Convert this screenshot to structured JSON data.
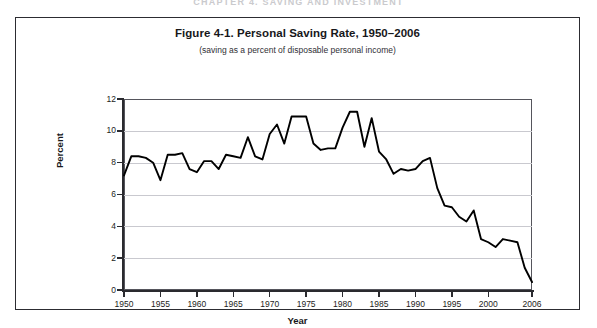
{
  "page": {
    "running_head": "CHAPTER 4. SAVING AND INVESTMENT"
  },
  "figure": {
    "title": "Figure 4-1. Personal Saving Rate, 1950–2006",
    "subtitle": "(saving as a percent of disposable personal income)"
  },
  "chart_data": {
    "type": "line",
    "title": "Figure 4-1. Personal Saving Rate, 1950–2006",
    "subtitle": "(saving as a percent of disposable personal income)",
    "xlabel": "Year",
    "ylabel": "Percent",
    "xlim": [
      1950,
      2006
    ],
    "ylim": [
      0,
      12
    ],
    "grid": true,
    "grid_axis": "y",
    "legend": false,
    "line_color": "#000000",
    "x_ticks": [
      1950,
      1955,
      1960,
      1965,
      1970,
      1975,
      1980,
      1985,
      1990,
      1995,
      2000,
      2006
    ],
    "x_tick_labels": [
      "1950",
      "1955",
      "1960",
      "1965",
      "1970",
      "1975",
      "1980",
      "1985",
      "1990",
      "1995",
      "2000",
      "2006"
    ],
    "y_ticks": [
      0,
      2,
      4,
      6,
      8,
      10,
      12
    ],
    "y_tick_labels": [
      "0",
      "2",
      "4",
      "6",
      "8",
      "10",
      "12"
    ],
    "series": [
      {
        "name": "Personal saving rate",
        "x": [
          1950,
          1951,
          1952,
          1953,
          1954,
          1955,
          1956,
          1957,
          1958,
          1959,
          1960,
          1961,
          1962,
          1963,
          1964,
          1965,
          1966,
          1967,
          1968,
          1969,
          1970,
          1971,
          1972,
          1973,
          1974,
          1975,
          1976,
          1977,
          1978,
          1979,
          1980,
          1981,
          1982,
          1983,
          1984,
          1985,
          1986,
          1987,
          1988,
          1989,
          1990,
          1991,
          1992,
          1993,
          1994,
          1995,
          1996,
          1997,
          1998,
          1999,
          2000,
          2001,
          2002,
          2003,
          2004,
          2005,
          2006
        ],
        "values": [
          7.2,
          8.4,
          8.4,
          8.3,
          8.0,
          6.9,
          8.5,
          8.5,
          8.6,
          7.6,
          7.4,
          8.1,
          8.1,
          7.6,
          8.5,
          8.4,
          8.3,
          9.6,
          8.4,
          8.2,
          9.8,
          10.4,
          9.2,
          10.9,
          10.9,
          10.9,
          9.2,
          8.8,
          8.9,
          8.9,
          10.2,
          11.2,
          11.2,
          9.0,
          10.8,
          8.7,
          8.2,
          7.3,
          7.6,
          7.5,
          7.6,
          8.1,
          8.3,
          6.4,
          5.3,
          5.2,
          4.6,
          4.3,
          5.0,
          3.2,
          3.0,
          2.7,
          3.2,
          3.1,
          3.0,
          1.4,
          0.5
        ]
      }
    ]
  }
}
